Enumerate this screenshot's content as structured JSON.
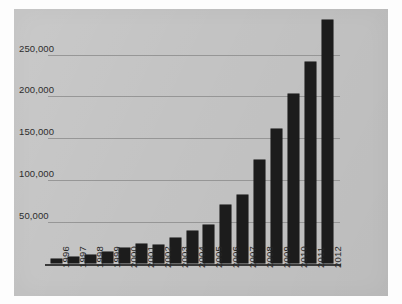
{
  "chart_data": {
    "type": "bar",
    "title": "",
    "subtitle": "",
    "xlabel": "",
    "ylabel": "",
    "grid": true,
    "legend": false,
    "legend_position": "none",
    "orientation": "vertical",
    "bar_color": "#1c1c1c",
    "background_color": "#c3c3c3",
    "gridline_color": "#8e8e8e",
    "axis_color": "#3a3a3a",
    "xlim": [
      "1996",
      "2012"
    ],
    "ylim": [
      0,
      290000
    ],
    "ytick_values": [
      50000,
      100000,
      150000,
      200000,
      250000
    ],
    "ytick_labels": [
      "50,000",
      "100,000",
      "150,000",
      "200,000",
      "250,000"
    ],
    "categories": [
      "1996",
      "1997",
      "1998",
      "1999",
      "2000",
      "2001",
      "2002",
      "2003",
      "2004",
      "2005",
      "2006",
      "2007",
      "2008",
      "2009",
      "2010",
      "2011",
      "2012"
    ],
    "values": [
      5500,
      7500,
      10000,
      14000,
      18000,
      23500,
      22000,
      30500,
      38500,
      45500,
      69500,
      81500,
      123500,
      161000,
      203000,
      241000,
      291000
    ],
    "series": [
      {
        "name": "",
        "values": [
          5500,
          7500,
          10000,
          14000,
          18000,
          23500,
          22000,
          30500,
          38500,
          45500,
          69500,
          81500,
          123500,
          161000,
          203000,
          241000,
          291000
        ]
      }
    ],
    "annotations": []
  }
}
